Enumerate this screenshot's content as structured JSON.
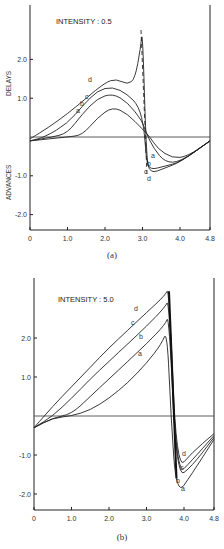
{
  "chart_data": [
    {
      "type": "line",
      "panel": "(a)",
      "title": "INTENSITY : 0.5",
      "xlabel": "",
      "ylabel_positive": "DELAYS",
      "ylabel_negative": "ADVANCES",
      "xlim": [
        0,
        4.8
      ],
      "ylim": [
        -2.4,
        3.4
      ],
      "x_ticks": [
        "0",
        "1.0",
        "2.0",
        "3.0",
        "4.0",
        "4.8"
      ],
      "y_ticks": [
        "2.0",
        "1.0",
        "-1.0",
        "-2.0"
      ],
      "grid": false,
      "series": [
        {
          "name": "a",
          "x": [
            0,
            1.0,
            1.4,
            1.8,
            2.2,
            2.6,
            3.0,
            3.2,
            3.4,
            3.8,
            4.2,
            4.8
          ],
          "y": [
            -0.1,
            0,
            0.05,
            0.5,
            0.78,
            0.6,
            0.2,
            0,
            -0.3,
            -0.55,
            -0.5,
            -0.1
          ]
        },
        {
          "name": "b",
          "x": [
            0,
            0.6,
            1.0,
            1.4,
            1.8,
            2.2,
            2.6,
            3.0,
            3.1,
            3.3,
            3.6,
            4.0,
            4.8
          ],
          "y": [
            -0.1,
            0,
            0.1,
            0.6,
            1.0,
            1.12,
            0.9,
            0.4,
            0.1,
            -0.3,
            -0.65,
            -0.65,
            -0.1
          ]
        },
        {
          "name": "c",
          "x": [
            0,
            0.4,
            1.0,
            1.4,
            1.8,
            2.2,
            2.6,
            2.9,
            3.05,
            3.1,
            3.2,
            3.6,
            4.0,
            4.8
          ],
          "y": [
            -0.1,
            0,
            0.35,
            0.8,
            1.2,
            1.3,
            1.1,
            0.8,
            0.2,
            -0.6,
            -0.85,
            -0.75,
            -0.65,
            -0.1
          ]
        },
        {
          "name": "d",
          "x": [
            0,
            0.5,
            1.0,
            1.5,
            2.0,
            2.3,
            2.6,
            2.8,
            2.95,
            3.0,
            3.1,
            3.2,
            3.6,
            4.0,
            4.8
          ],
          "y": [
            -0.05,
            0.25,
            0.6,
            1.0,
            1.4,
            1.5,
            1.35,
            1.5,
            2.3,
            2.8,
            -0.5,
            -0.95,
            -0.8,
            -0.65,
            -0.1
          ]
        }
      ],
      "annotations": [
        "dashed vertical drop near x≈3.0 for curve d"
      ]
    },
    {
      "type": "line",
      "panel": "(b)",
      "title": "INTENSITY : 5.0",
      "xlabel": "",
      "ylabel_positive": "",
      "ylabel_negative": "",
      "xlim": [
        0,
        4.8
      ],
      "ylim": [
        -2.4,
        3.4
      ],
      "x_ticks": [
        "0",
        "1.0",
        "2.0",
        "3.0",
        "4.0",
        "4.8"
      ],
      "y_ticks": [
        "2.0",
        "1.0",
        "-1.0",
        "-2.0"
      ],
      "grid": false,
      "series": [
        {
          "name": "a",
          "x": [
            0,
            0.5,
            1.0,
            1.5,
            2.0,
            2.5,
            3.0,
            3.4,
            3.55,
            3.65,
            3.8,
            4.2,
            4.8
          ],
          "y": [
            -0.3,
            -0.05,
            0,
            0.15,
            0.45,
            0.85,
            1.35,
            1.85,
            2.2,
            0.0,
            -2.05,
            -1.5,
            -0.6
          ]
        },
        {
          "name": "b",
          "x": [
            0,
            0.5,
            1.0,
            1.5,
            2.0,
            2.5,
            3.0,
            3.5,
            3.6,
            3.8,
            4.2,
            4.8
          ],
          "y": [
            -0.3,
            -0.05,
            0.05,
            0.5,
            0.95,
            1.4,
            1.85,
            2.35,
            2.6,
            -1.6,
            -1.3,
            -0.55
          ]
        },
        {
          "name": "c",
          "x": [
            0,
            0.5,
            1.0,
            1.5,
            2.0,
            2.5,
            3.0,
            3.5,
            3.6,
            3.8,
            4.2,
            4.8
          ],
          "y": [
            -0.3,
            0,
            0.45,
            0.95,
            1.4,
            1.85,
            2.3,
            2.8,
            3.0,
            -1.55,
            -1.15,
            -0.5
          ]
        },
        {
          "name": "d",
          "x": [
            0,
            0.5,
            1.0,
            1.5,
            2.0,
            2.5,
            3.0,
            3.5,
            3.6,
            3.8,
            4.2,
            4.8
          ],
          "y": [
            -0.3,
            0.25,
            0.75,
            1.25,
            1.75,
            2.2,
            2.65,
            3.1,
            3.3,
            -1.4,
            -0.95,
            -0.45
          ]
        }
      ]
    }
  ],
  "captions": {
    "a": "(a)",
    "b": "(b)"
  }
}
